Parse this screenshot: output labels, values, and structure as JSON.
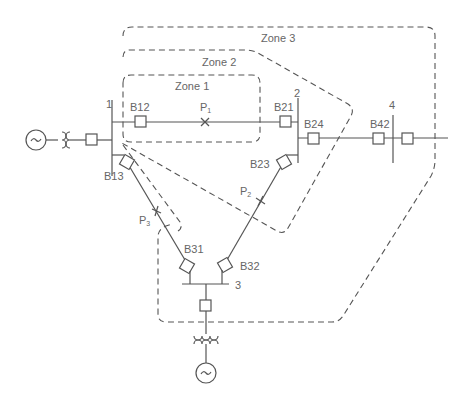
{
  "diagram": {
    "type": "power-system-protection-zones",
    "zones": [
      {
        "id": "zone1",
        "label": "Zone 1"
      },
      {
        "id": "zone2",
        "label": "Zone 2"
      },
      {
        "id": "zone3",
        "label": "Zone 3"
      }
    ],
    "buses": [
      {
        "id": "bus1",
        "label": "1"
      },
      {
        "id": "bus2",
        "label": "2"
      },
      {
        "id": "bus3",
        "label": "3"
      },
      {
        "id": "bus4",
        "label": "4"
      }
    ],
    "breakers": [
      {
        "id": "B12",
        "label": "B12"
      },
      {
        "id": "B21",
        "label": "B21"
      },
      {
        "id": "B13",
        "label": "B13"
      },
      {
        "id": "B23",
        "label": "B23"
      },
      {
        "id": "B24",
        "label": "B24"
      },
      {
        "id": "B42",
        "label": "B42"
      },
      {
        "id": "B31",
        "label": "B31"
      },
      {
        "id": "B32",
        "label": "B32"
      }
    ],
    "fault_points": [
      {
        "id": "P1",
        "label": "P",
        "sub": "1"
      },
      {
        "id": "P2",
        "label": "P",
        "sub": "2"
      },
      {
        "id": "P3",
        "label": "P",
        "sub": "3"
      }
    ],
    "generators": [
      {
        "id": "gen1",
        "symbol": "~"
      },
      {
        "id": "gen3",
        "symbol": "~"
      }
    ],
    "colors": {
      "line": "#555555",
      "text": "#666666",
      "background": "#ffffff"
    }
  }
}
